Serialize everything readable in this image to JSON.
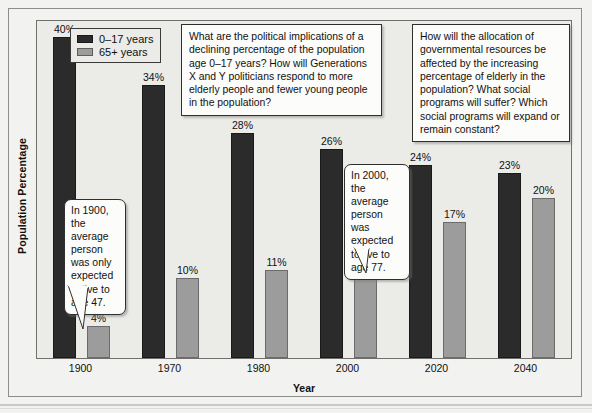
{
  "chart_data": {
    "type": "bar",
    "title": "",
    "xlabel": "Year",
    "ylabel": "Population Percentage",
    "categories": [
      "1900",
      "1970",
      "1980",
      "2000",
      "2020",
      "2040"
    ],
    "ylim": [
      0,
      42
    ],
    "grid": false,
    "legend_position": "top-left",
    "series": [
      {
        "name": "0–17 years",
        "color": "#2b2b2b",
        "values": [
          40,
          34,
          28,
          26,
          24,
          23
        ],
        "labels": [
          "40%",
          "34%",
          "28%",
          "26%",
          "24%",
          "23%"
        ]
      },
      {
        "name": "65+ years",
        "color": "#9c9c9c",
        "values": [
          4,
          10,
          11,
          12,
          17,
          20
        ],
        "labels": [
          "4%",
          "10%",
          "11%",
          "12%",
          "17%",
          "20%"
        ]
      }
    ],
    "annotations": [
      {
        "id": "bubble-1900",
        "kind": "speech-bubble",
        "text": "In 1900, the average person was only expected to live to age 47.",
        "points_to": "1900 / 65+ years bar"
      },
      {
        "id": "bubble-2000",
        "kind": "speech-bubble",
        "text": "In 2000, the average person was expected to live to age 77.",
        "points_to": "2000 / 65+ years bar"
      },
      {
        "id": "qbox-1",
        "kind": "callout-box",
        "text": "What are the political implications of a declining percentage of the population age 0–17 years? How will Generations X and Y politicians respond to more elderly people and fewer young people in the population?"
      },
      {
        "id": "qbox-2",
        "kind": "callout-box",
        "text": "How will the allocation of governmental resources be affected by the increasing percentage of elderly in the population? What social programs will suffer? Which social programs will expand or remain constant?"
      }
    ]
  },
  "legend": {
    "items": [
      {
        "label": "0–17 years"
      },
      {
        "label": "65+ years"
      }
    ]
  },
  "axes": {
    "x_title": "Year",
    "y_title": "Population Percentage",
    "x_ticks": [
      "1900",
      "1970",
      "1980",
      "2000",
      "2020",
      "2040"
    ]
  },
  "bar_labels": {
    "young": [
      "40%",
      "34%",
      "28%",
      "26%",
      "24%",
      "23%"
    ],
    "old": [
      "4%",
      "10%",
      "11%",
      "12%",
      "17%",
      "20%"
    ]
  },
  "callouts": {
    "question_left": "What are the political implications of a declining percentage of the population age 0–17 years? How will Generations X and Y politicians respond to more elderly people and fewer young people in the population?",
    "question_right": "How will the allocation of governmental resources be affected by the increasing percentage of elderly in the population? What social programs will suffer? Which social programs will expand or remain constant?",
    "bubble_1900": "In 1900, the average person was only expected to live to age 47.",
    "bubble_2000": "In 2000, the average person was expected to live to age 77."
  },
  "colors": {
    "young_bar": "#2b2b2b",
    "old_bar": "#9c9c9c",
    "plot_background": "#ebebe8",
    "page_background": "#f2f2f0",
    "callout_background": "#fcfcfa"
  }
}
